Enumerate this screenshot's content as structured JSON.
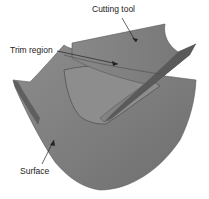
{
  "labels": {
    "cutting_tool": "Cutting tool",
    "trim_region": "Trim region",
    "surface": "Surface"
  },
  "colors": {
    "surface_fill": "#8a8a8a",
    "tool_fill": "#7d7d7d",
    "edge": "#4a4a4a",
    "arrow": "#222222"
  }
}
